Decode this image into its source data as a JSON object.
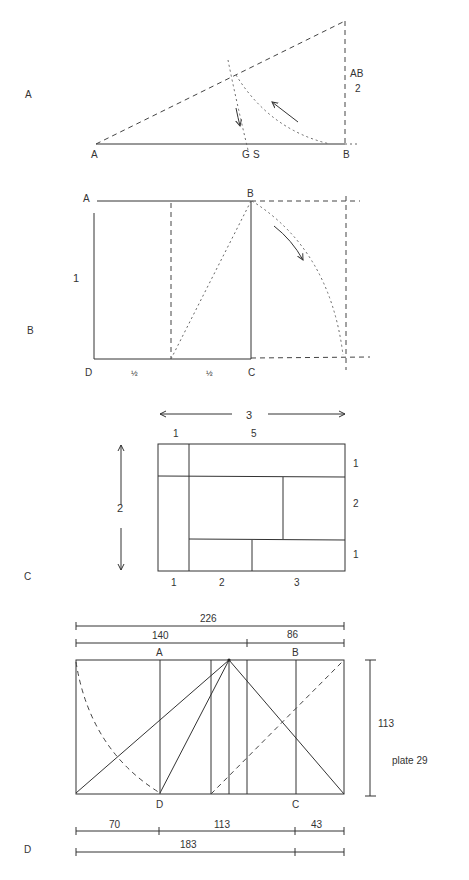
{
  "page": {
    "plate_label": "plate 29"
  },
  "figures": {
    "A": {
      "section_label": "A",
      "points": {
        "A": "A",
        "G": "G",
        "S": "S",
        "B": "B"
      },
      "vertical_label_top": "AB",
      "vertical_label_bottom": "2"
    },
    "B": {
      "section_label": "B",
      "corners": {
        "A": "A",
        "B": "B",
        "C": "C",
        "D": "D"
      },
      "side_label": "1",
      "bottom_halves": [
        "½",
        "½"
      ]
    },
    "C": {
      "section_label": "C",
      "top_span": "3",
      "left_span": "2",
      "top_labels": [
        "1",
        "5"
      ],
      "right_labels": [
        "1",
        "2",
        "1"
      ],
      "bottom_labels": [
        "1",
        "2",
        "3"
      ]
    },
    "D": {
      "section_label": "D",
      "top_dims": {
        "total": "226",
        "left": "140",
        "right": "86"
      },
      "points": {
        "A": "A",
        "B": "B",
        "C": "C",
        "D": "D"
      },
      "height_dim": "113",
      "bottom_dims": {
        "left": "70",
        "middle": "113",
        "right": "43",
        "total": "183"
      }
    }
  }
}
